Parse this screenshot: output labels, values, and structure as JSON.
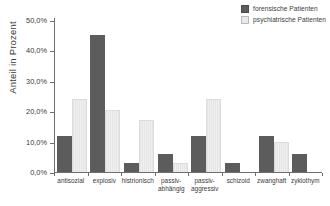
{
  "legend": {
    "items": [
      {
        "label": "forensische Patienten",
        "color": "#5c5c5c",
        "key": "forensic"
      },
      {
        "label": "psychiatrische Patienten",
        "color": "#e9e9e9",
        "key": "psychiatric"
      }
    ]
  },
  "axis": {
    "ylabel": "Anteil in Prozent",
    "yticks": [
      "0,0%",
      "10,0%",
      "20,0%",
      "30,0%",
      "40,0%",
      "50,0%"
    ]
  },
  "chart_data": {
    "type": "bar",
    "title": "",
    "xlabel": "",
    "ylabel": "Anteil in Prozent",
    "ylim": [
      0,
      50
    ],
    "ytick_values": [
      0,
      10,
      20,
      30,
      40,
      50
    ],
    "ytick_labels": [
      "0,0%",
      "10,0%",
      "20,0%",
      "30,0%",
      "40,0%",
      "50,0%"
    ],
    "grid": false,
    "legend_position": "top-right",
    "categories": [
      "antisozial",
      "explosiv",
      "histrionisch",
      "passiv-abhängig",
      "passiv-aggressiv",
      "schizoid",
      "zwanghaft",
      "zyklothym"
    ],
    "category_lines": [
      [
        "antisozial",
        ""
      ],
      [
        "explosiv",
        ""
      ],
      [
        "histrionisch",
        ""
      ],
      [
        "passiv-",
        "abhängig"
      ],
      [
        "passiv-",
        "aggressiv"
      ],
      [
        "schizoid",
        ""
      ],
      [
        "zwanghaft",
        ""
      ],
      [
        "zyklothym",
        ""
      ]
    ],
    "series": [
      {
        "name": "forensische Patienten",
        "color": "#5c5c5c",
        "values": [
          12.0,
          45.0,
          3.0,
          6.0,
          12.0,
          3.0,
          12.0,
          6.0
        ]
      },
      {
        "name": "psychiatrische Patienten",
        "color": "#e9e9e9",
        "values": [
          24.0,
          20.5,
          17.0,
          3.0,
          24.0,
          0.0,
          10.0,
          0.0
        ]
      }
    ]
  }
}
